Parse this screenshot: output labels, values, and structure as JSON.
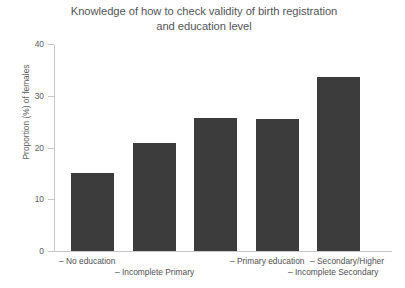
{
  "chart_data": {
    "type": "bar",
    "title": "Knowledge of how to check validity of birth registration and education level",
    "title_line1": "Knowledge of how to check validity of birth registration",
    "title_line2": "and education level",
    "xlabel": "",
    "ylabel": "Proportion (%) of females",
    "ylim": [
      0,
      40
    ],
    "yticks": [
      0,
      10,
      20,
      30,
      40
    ],
    "ytick_labels": [
      "0",
      "10",
      "20",
      "30",
      "40"
    ],
    "grid": false,
    "legend": false,
    "bar_color": "#3c3c3c",
    "axis_color": "#c9c9c9",
    "text_color": "#55565a",
    "background": "#ffffff",
    "categories": [
      "No education",
      "Incomplete Primary",
      "Primary education",
      "Incomplete Secondary",
      "Secondary/Higher"
    ],
    "category_labels": [
      "– No education",
      "– Incomplete Primary",
      "– Primary education",
      "– Incomplete Secondary",
      "– Secondary/Higher"
    ],
    "values": [
      15.0,
      20.8,
      25.8,
      25.5,
      33.7
    ],
    "label_rows": [
      0,
      1,
      0,
      1,
      0
    ]
  }
}
